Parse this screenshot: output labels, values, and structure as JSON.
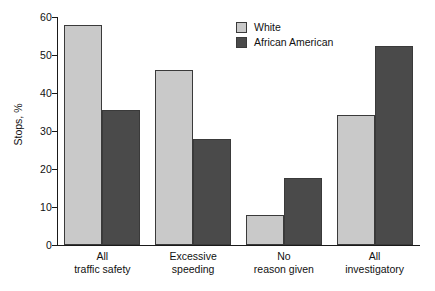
{
  "chart_data": {
    "type": "bar",
    "title": "",
    "xlabel": "",
    "ylabel": "Stops, %",
    "ylim": [
      0,
      60
    ],
    "yticks": [
      0,
      10,
      20,
      30,
      40,
      50,
      60
    ],
    "ytick_labels": [
      "0",
      "10",
      "20",
      "30",
      "40",
      "50",
      "60"
    ],
    "grid": false,
    "legend_position": "top-right",
    "categories": [
      "All\ntraffic safety",
      "Excessive\nspeeding",
      "No\nreason given",
      "All\ninvestigatory"
    ],
    "category_lines": [
      [
        "All",
        "traffic safety"
      ],
      [
        "Excessive",
        "speeding"
      ],
      [
        "No",
        "reason given"
      ],
      [
        "All",
        "investigatory"
      ]
    ],
    "series": [
      {
        "name": "White",
        "color": "#c9c9c9",
        "values": [
          58.0,
          46.0,
          8.0,
          34.2
        ]
      },
      {
        "name": "African American",
        "color": "#4a4a4a",
        "values": [
          35.6,
          27.8,
          17.6,
          52.5
        ]
      }
    ]
  },
  "legend": {
    "items": [
      {
        "label": "White",
        "color": "#c9c9c9"
      },
      {
        "label": "African American",
        "color": "#4a4a4a"
      }
    ]
  },
  "axis": {
    "y_title": "Stops, %"
  }
}
